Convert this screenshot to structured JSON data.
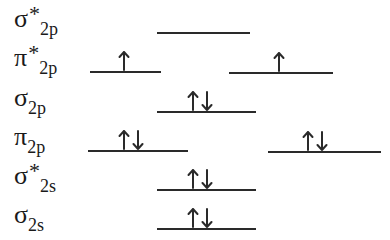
{
  "diagram": {
    "type": "molecular-orbital-energy-diagram",
    "orbitals": [
      {
        "id": "sigma-star-2p",
        "symbol": "σ",
        "star": "*",
        "subscript": "2p",
        "label_top": 6,
        "levels": [
          {
            "x": 157,
            "w": 93,
            "y": 32,
            "electrons": []
          }
        ]
      },
      {
        "id": "pi-star-2p",
        "symbol": "π",
        "star": "*",
        "subscript": "2p",
        "label_top": 45,
        "levels": [
          {
            "x": 90,
            "w": 71,
            "y": 71,
            "electrons": [
              "up"
            ]
          },
          {
            "x": 229,
            "w": 104,
            "y": 72,
            "electrons": [
              "up"
            ]
          }
        ]
      },
      {
        "id": "sigma-2p",
        "symbol": "σ",
        "star": "",
        "subscript": "2p",
        "label_top": 85,
        "levels": [
          {
            "x": 157,
            "w": 99,
            "y": 111,
            "electrons": [
              "up",
              "down"
            ]
          }
        ]
      },
      {
        "id": "pi-2p",
        "symbol": "π",
        "star": "",
        "subscript": "2p",
        "label_top": 124,
        "levels": [
          {
            "x": 88,
            "w": 100,
            "y": 150,
            "electrons": [
              "up",
              "down"
            ]
          },
          {
            "x": 268,
            "w": 113,
            "y": 151,
            "electrons": [
              "up",
              "down"
            ]
          }
        ]
      },
      {
        "id": "sigma-star-2s",
        "symbol": "σ",
        "star": "*",
        "subscript": "2s",
        "label_top": 163,
        "levels": [
          {
            "x": 157,
            "w": 99,
            "y": 189,
            "electrons": [
              "up",
              "down"
            ]
          }
        ]
      },
      {
        "id": "sigma-2s",
        "symbol": "σ",
        "star": "",
        "subscript": "2s",
        "label_top": 202,
        "levels": [
          {
            "x": 157,
            "w": 99,
            "y": 228,
            "electrons": [
              "up",
              "down"
            ]
          }
        ]
      }
    ],
    "colors": {
      "line": "#2a2a2a",
      "text": "#1a1a1a",
      "background": "#ffffff"
    }
  }
}
